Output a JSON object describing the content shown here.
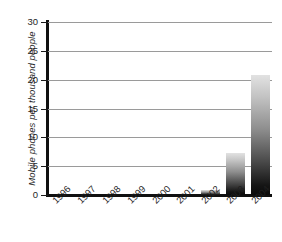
{
  "chart_data": {
    "type": "bar",
    "title": "",
    "xlabel": "",
    "ylabel": "Mobile phones per thousand people",
    "categories": [
      "1996",
      "1997",
      "1998",
      "1999",
      "2000",
      "2001",
      "2002",
      "2003",
      "2004"
    ],
    "values": [
      0,
      0,
      0,
      0,
      0,
      0,
      0.8,
      7.2,
      20.8
    ],
    "ylim": [
      0,
      30
    ],
    "ytick_labels": [
      "0",
      "5",
      "10",
      "15",
      "20",
      "25",
      "30"
    ],
    "ytick_values": [
      0,
      5,
      10,
      15,
      20,
      25,
      30
    ],
    "grid": true,
    "legend": "none",
    "bar_style": "vertical-gradient light-top to black-bottom",
    "colors": {
      "bar_top": "#e2e2e2",
      "bar_bottom": "#0a0a0a",
      "gridline": "#9a9a9a",
      "axis": "#101010",
      "text": "#1f1f1f",
      "background": "#ffffff"
    }
  }
}
